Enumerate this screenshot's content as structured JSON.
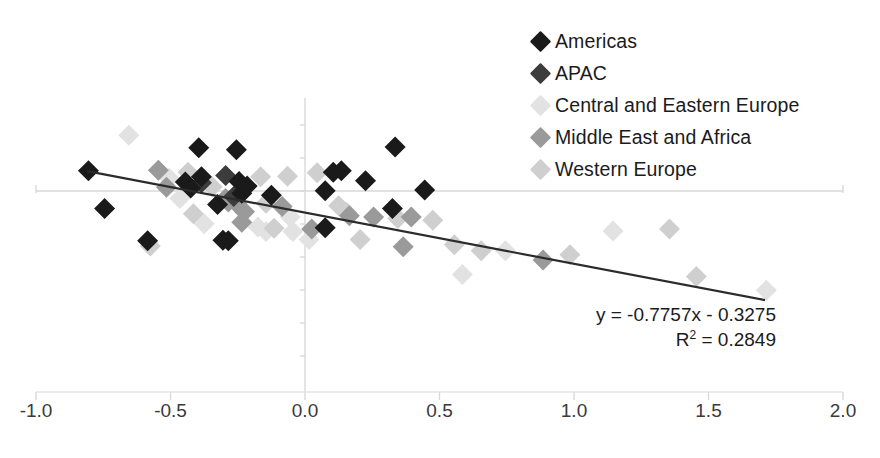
{
  "chart_data": {
    "type": "scatter",
    "title": "",
    "xlabel": "",
    "ylabel": "",
    "xlim": [
      -1.0,
      2.0
    ],
    "ylim": [
      -2.8,
      1.7
    ],
    "grid": false,
    "legend_position": "top-right",
    "xticks": [
      -1.0,
      -0.5,
      0.0,
      0.5,
      1.0,
      1.5,
      2.0
    ],
    "xticklabels": [
      "-1.0",
      "-0.5",
      "0.0",
      "0.5",
      "1.0",
      "1.5",
      "2.0"
    ],
    "yticks": [
      -2.5,
      -2.0,
      -1.5,
      -1.0,
      -0.5,
      0.0,
      0.5,
      1.0,
      1.5
    ],
    "yticklabels": [],
    "annotations": [
      "y = -0.7757x - 0.3275",
      "R² = 0.2849"
    ],
    "trendline": {
      "type": "linear",
      "equation": "y = -0.7757x - 0.3275",
      "slope": -0.7757,
      "intercept": -0.3275,
      "r_squared": 0.2849,
      "x_start": -0.81,
      "x_end": 1.71,
      "color": "#2b2b2b"
    },
    "series": [
      {
        "name": "Americas",
        "color": "#1a1a1a",
        "marker": "diamond",
        "points": [
          [
            -0.805,
            0.305
          ],
          [
            -0.745,
            -0.265
          ],
          [
            -0.585,
            -0.755
          ],
          [
            -0.445,
            0.135
          ],
          [
            -0.425,
            0.045
          ],
          [
            -0.395,
            0.655
          ],
          [
            -0.385,
            0.215
          ],
          [
            -0.325,
            -0.205
          ],
          [
            -0.305,
            -0.745
          ],
          [
            -0.285,
            -0.755
          ],
          [
            -0.255,
            0.625
          ],
          [
            -0.245,
            0.145
          ],
          [
            -0.235,
            -0.035
          ],
          [
            -0.215,
            0.075
          ],
          [
            -0.125,
            -0.065
          ],
          [
            0.075,
            -0.555
          ],
          [
            0.075,
            0.005
          ],
          [
            0.105,
            0.285
          ],
          [
            0.135,
            0.305
          ],
          [
            0.225,
            0.155
          ],
          [
            0.335,
            0.665
          ],
          [
            0.325,
            -0.265
          ],
          [
            0.445,
            0.015
          ]
        ]
      },
      {
        "name": "APAC",
        "color": "#3c3c3c",
        "marker": "diamond",
        "points": [
          [
            -0.385,
            0.125
          ],
          [
            -0.295,
            0.235
          ],
          [
            -0.265,
            -0.085
          ]
        ]
      },
      {
        "name": "Central and Eastern Europe",
        "color": "#e2e2e2",
        "marker": "diamond",
        "points": [
          [
            -0.655,
            0.845
          ],
          [
            -0.505,
            0.195
          ],
          [
            -0.465,
            -0.115
          ],
          [
            -0.375,
            -0.495
          ],
          [
            -0.175,
            -0.545
          ],
          [
            -0.145,
            -0.615
          ],
          [
            -0.055,
            -0.395
          ],
          [
            -0.045,
            -0.615
          ],
          [
            0.015,
            -0.735
          ],
          [
            0.585,
            -1.265
          ],
          [
            0.745,
            -0.905
          ],
          [
            1.145,
            -0.605
          ],
          [
            1.715,
            -1.505
          ]
        ]
      },
      {
        "name": "Middle East and Africa",
        "color": "#9a9a9a",
        "marker": "diamond",
        "points": [
          [
            -0.545,
            0.315
          ],
          [
            -0.515,
            0.055
          ],
          [
            -0.295,
            -0.115
          ],
          [
            -0.285,
            -0.165
          ],
          [
            -0.255,
            -0.185
          ],
          [
            -0.235,
            -0.475
          ],
          [
            -0.225,
            -0.315
          ],
          [
            -0.085,
            -0.235
          ],
          [
            0.025,
            -0.575
          ],
          [
            0.165,
            -0.375
          ],
          [
            0.255,
            -0.395
          ],
          [
            0.365,
            -0.845
          ],
          [
            0.395,
            -0.395
          ],
          [
            0.885,
            -1.045
          ]
        ]
      },
      {
        "name": "Western Europe",
        "color": "#cfcfcf",
        "marker": "diamond",
        "points": [
          [
            -0.575,
            -0.835
          ],
          [
            -0.435,
            0.285
          ],
          [
            -0.415,
            -0.345
          ],
          [
            -0.345,
            0.065
          ],
          [
            -0.165,
            0.215
          ],
          [
            -0.145,
            -0.185
          ],
          [
            -0.115,
            -0.565
          ],
          [
            -0.065,
            0.225
          ],
          [
            0.045,
            0.275
          ],
          [
            0.125,
            -0.225
          ],
          [
            0.155,
            -0.325
          ],
          [
            0.205,
            -0.735
          ],
          [
            0.345,
            -0.415
          ],
          [
            0.475,
            -0.445
          ],
          [
            0.555,
            -0.815
          ],
          [
            0.655,
            -0.905
          ],
          [
            0.985,
            -0.965
          ],
          [
            1.355,
            -0.575
          ],
          [
            1.455,
            -1.295
          ]
        ]
      }
    ]
  },
  "legend": {
    "items": [
      {
        "label": "Americas",
        "color": "#1a1a1a"
      },
      {
        "label": "APAC",
        "color": "#3c3c3c"
      },
      {
        "label": "Central and Eastern Europe",
        "color": "#e2e2e2"
      },
      {
        "label": "Middle East and Africa",
        "color": "#9a9a9a"
      },
      {
        "label": "Western Europe",
        "color": "#cfcfcf"
      }
    ]
  },
  "equation": {
    "line1": "y = -0.7757x - 0.3275",
    "r2_prefix": "R",
    "r2_exponent": "2",
    "r2_value": " = 0.2849"
  },
  "axes": {
    "axis_color": "#d9d9d9",
    "tick_label_color": "#3a3a3a"
  }
}
